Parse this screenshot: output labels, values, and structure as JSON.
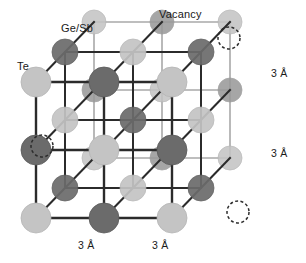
{
  "figure": {
    "name": "crystal-lattice-diagram"
  },
  "labels": {
    "ge_sb": "Ge/Sb",
    "te": "Te",
    "vacancy": "Vacancy",
    "dim_right_top": "3 Å",
    "dim_right_bottom": "3 Å",
    "dim_bottom_left": "3 Å",
    "dim_bottom_right": "3 Å"
  },
  "colors": {
    "background": "#ffffff",
    "bond_front": "#2b2b2b",
    "bond_back": "#a8a8a8",
    "atom_dark": "#6b6b6b",
    "atom_dark_edge": "#5a5a5a",
    "atom_light": "#c4c4c4",
    "atom_light_edge": "#b5b5b5",
    "atom_mid": "#9a9a9a",
    "vacancy_stroke": "#2b2b2b",
    "text": "#1a1a1a"
  },
  "geometry": {
    "origin_x": 36,
    "origin_y": 218,
    "cell_x": 68,
    "cell_y": 68,
    "depth_dx": 29,
    "depth_dy": -30,
    "n": 2,
    "atom_radius_front": 15,
    "atom_radius_mid": 13,
    "atom_radius_back": 12
  },
  "atoms": [
    {
      "i": 0,
      "j": 0,
      "k": 0,
      "type": "Te"
    },
    {
      "i": 1,
      "j": 0,
      "k": 0,
      "type": "Ge/Sb"
    },
    {
      "i": 2,
      "j": 0,
      "k": 0,
      "type": "Te"
    },
    {
      "i": 0,
      "j": 1,
      "k": 0,
      "type": "Ge/Sb"
    },
    {
      "i": 1,
      "j": 1,
      "k": 0,
      "type": "Te"
    },
    {
      "i": 2,
      "j": 1,
      "k": 0,
      "type": "Ge/Sb"
    },
    {
      "i": 0,
      "j": 2,
      "k": 0,
      "type": "Te"
    },
    {
      "i": 1,
      "j": 2,
      "k": 0,
      "type": "Ge/Sb"
    },
    {
      "i": 2,
      "j": 2,
      "k": 0,
      "type": "Te"
    },
    {
      "i": 0,
      "j": 0,
      "k": 1,
      "type": "Ge/Sb"
    },
    {
      "i": 1,
      "j": 0,
      "k": 1,
      "type": "Te"
    },
    {
      "i": 2,
      "j": 0,
      "k": 1,
      "type": "Ge/Sb"
    },
    {
      "i": 0,
      "j": 1,
      "k": 1,
      "type": "Te"
    },
    {
      "i": 1,
      "j": 1,
      "k": 1,
      "type": "Ge/Sb"
    },
    {
      "i": 2,
      "j": 1,
      "k": 1,
      "type": "Te"
    },
    {
      "i": 0,
      "j": 2,
      "k": 1,
      "type": "Ge/Sb"
    },
    {
      "i": 1,
      "j": 2,
      "k": 1,
      "type": "Te"
    },
    {
      "i": 2,
      "j": 2,
      "k": 1,
      "type": "Ge/Sb"
    },
    {
      "i": 0,
      "j": 0,
      "k": 2,
      "type": "Te"
    },
    {
      "i": 1,
      "j": 0,
      "k": 2,
      "type": "Ge/Sb"
    },
    {
      "i": 2,
      "j": 0,
      "k": 2,
      "type": "Te"
    },
    {
      "i": 0,
      "j": 1,
      "k": 2,
      "type": "Ge/Sb"
    },
    {
      "i": 1,
      "j": 1,
      "k": 2,
      "type": "Te"
    },
    {
      "i": 2,
      "j": 1,
      "k": 2,
      "type": "Ge/Sb"
    },
    {
      "i": 0,
      "j": 2,
      "k": 2,
      "type": "Te"
    },
    {
      "i": 1,
      "j": 2,
      "k": 2,
      "type": "Ge/Sb"
    },
    {
      "i": 2,
      "j": 2,
      "k": 2,
      "type": "Te"
    }
  ],
  "vacancies": [
    {
      "x": 229,
      "y": 38,
      "r": 11
    },
    {
      "x": 42,
      "y": 146,
      "r": 11
    },
    {
      "x": 238,
      "y": 212,
      "r": 11
    }
  ],
  "label_positions": {
    "ge_sb": {
      "x": 61,
      "y": 23
    },
    "te": {
      "x": 17,
      "y": 61
    },
    "vacancy": {
      "x": 159,
      "y": 9
    },
    "dim_right_top": {
      "x": 271,
      "y": 68
    },
    "dim_right_bottom": {
      "x": 271,
      "y": 148
    },
    "dim_bottom_left": {
      "x": 78,
      "y": 240
    },
    "dim_bottom_right": {
      "x": 152,
      "y": 240
    }
  }
}
